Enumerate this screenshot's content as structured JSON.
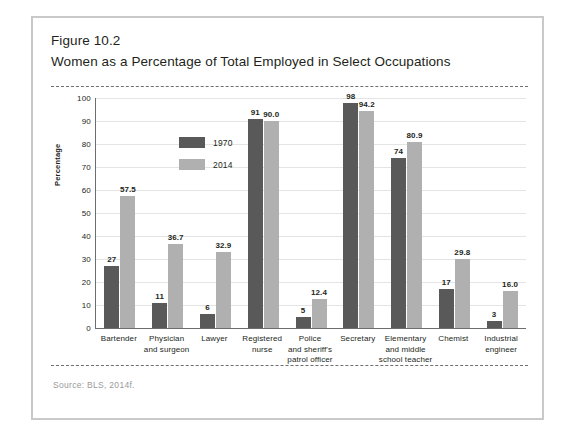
{
  "figure": {
    "number": "Figure 10.2",
    "title": "Women as a Percentage of Total Employed in Select Occupations",
    "source": "Source: BLS, 2014f."
  },
  "colors": {
    "series_1970": "#595959",
    "series_2014": "#b0b0b0",
    "frame": "#c9c9c9",
    "axis": "#6d6d6d",
    "grid": "#e4e4e4",
    "text": "#231f20",
    "source_text": "#9a9a9a"
  },
  "legend": {
    "position": "inside-top-left",
    "entries": [
      {
        "label": "1970",
        "color": "#595959"
      },
      {
        "label": "2014",
        "color": "#b0b0b0"
      }
    ]
  },
  "chart_data": {
    "type": "bar",
    "title": "Women as a Percentage of Total Employed in Select Occupations",
    "xlabel": "",
    "ylabel": "Percentage",
    "ylim": [
      0,
      100
    ],
    "ytick_step": 10,
    "yticks": [
      0,
      10,
      20,
      30,
      40,
      50,
      60,
      70,
      80,
      90,
      100
    ],
    "grid": true,
    "categories": [
      "Bartender",
      "Physician and surgeon",
      "Lawyer",
      "Registered nurse",
      "Police and sheriff's patrol officer",
      "Secretary",
      "Elementary and middle school teacher",
      "Chemist",
      "Industrial engineer"
    ],
    "category_lines": [
      [
        "Bartender"
      ],
      [
        "Physician",
        "and surgeon"
      ],
      [
        "Lawyer"
      ],
      [
        "Registered",
        "nurse"
      ],
      [
        "Police",
        "and sheriff's",
        "patrol officer"
      ],
      [
        "Secretary"
      ],
      [
        "Elementary",
        "and middle",
        "school teacher"
      ],
      [
        "Chemist"
      ],
      [
        "Industrial",
        "engineer"
      ]
    ],
    "series": [
      {
        "name": "1970",
        "color": "#595959",
        "values": [
          27,
          11,
          6,
          91,
          5,
          98,
          74,
          17,
          3
        ],
        "labels": [
          "27",
          "11",
          "6",
          "91",
          "5",
          "98",
          "74",
          "17",
          "3"
        ]
      },
      {
        "name": "2014",
        "color": "#b0b0b0",
        "values": [
          57.5,
          36.7,
          32.9,
          90.0,
          12.4,
          94.2,
          80.9,
          29.8,
          16.0
        ],
        "labels": [
          "57.5",
          "36.7",
          "32.9",
          "90.0",
          "12.4",
          "94.2",
          "80.9",
          "29.8",
          "16.0"
        ]
      }
    ]
  }
}
